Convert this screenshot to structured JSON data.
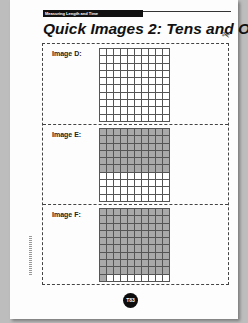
{
  "header": {
    "section_label": "Measuring Length and Time"
  },
  "title": "Quick Images 2: Tens and Ones",
  "images": [
    {
      "label": "Image D:",
      "shaded_cells": 0
    },
    {
      "label": "Image E:",
      "shaded_cells": 60
    },
    {
      "label": "Image F:",
      "shaded_cells": 91
    }
  ],
  "grid": {
    "rows": 10,
    "cols": 10,
    "shade_color": "#a9a9a9"
  },
  "page_number": "T83",
  "icons": {
    "cut_line": "scissors-icon"
  }
}
